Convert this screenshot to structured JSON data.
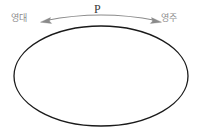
{
  "figure": {
    "type": "diagram",
    "background_color": "#ffffff"
  },
  "labels": {
    "left": "영대",
    "center": "P",
    "right": "영주"
  },
  "colors": {
    "ellipse_stroke": "#1a1a1a",
    "arrow_stroke": "#8a8a8a",
    "label_side_color": "#8d8d8d",
    "label_center_color": "#3a3a3a"
  },
  "shapes": {
    "ellipse": {
      "name": "ellipse",
      "center_x": 101,
      "center_y": 76,
      "radius_x": 87,
      "radius_y": 50,
      "stroke_width": 1.3,
      "fill": "none"
    },
    "arrow": {
      "name": "double-headed-curved-arrow",
      "start_x": 40,
      "start_y": 21,
      "end_x": 162,
      "end_y": 21,
      "apex_x": 101,
      "apex_y": 11,
      "stroke_width": 1.1,
      "heads": [
        "left",
        "right"
      ]
    }
  }
}
